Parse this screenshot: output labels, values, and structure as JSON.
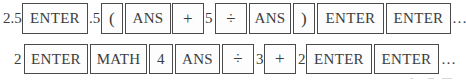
{
  "rows": [
    {
      "id": "row-1",
      "sequence": [
        {
          "type": "text",
          "value": "2.5"
        },
        {
          "type": "key",
          "label": "ENTER"
        },
        {
          "type": "text",
          "value": ".5"
        },
        {
          "type": "key",
          "label": "("
        },
        {
          "type": "key",
          "label": "ANS"
        },
        {
          "type": "key",
          "label": "+"
        },
        {
          "type": "text",
          "value": "5"
        },
        {
          "type": "key",
          "label": "÷"
        },
        {
          "type": "key",
          "label": "ANS"
        },
        {
          "type": "key",
          "label": ")"
        },
        {
          "type": "key",
          "label": "ENTER"
        },
        {
          "type": "key",
          "label": "ENTER"
        },
        {
          "type": "text",
          "value": "…"
        }
      ]
    },
    {
      "id": "row-2",
      "sequence": [
        {
          "type": "text",
          "value": "2"
        },
        {
          "type": "key",
          "label": "ENTER"
        },
        {
          "type": "key",
          "label": "MATH"
        },
        {
          "type": "key",
          "label": "4"
        },
        {
          "type": "key",
          "label": "ANS"
        },
        {
          "type": "key",
          "label": "÷"
        },
        {
          "type": "text",
          "value": "3"
        },
        {
          "type": "key",
          "label": "+"
        },
        {
          "type": "text",
          "value": "2"
        },
        {
          "type": "key",
          "label": "ENTER"
        },
        {
          "type": "key",
          "label": "ENTER"
        },
        {
          "type": "text",
          "value": "…"
        }
      ]
    }
  ]
}
